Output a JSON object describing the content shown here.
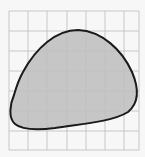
{
  "figure": {
    "background_color": "#f7f7f7",
    "grid": {
      "x_lines": [
        9,
        28,
        47,
        67,
        86,
        105,
        124,
        139
      ],
      "y_lines": [
        11,
        31,
        51,
        71,
        91,
        111,
        131,
        150
      ],
      "line_color": "#bfbfbf",
      "columns": 7,
      "rows": 7
    },
    "shape": {
      "fill_color": "#c6c6c6",
      "stroke_color": "#1a1a1a",
      "stroke_width": 2,
      "path": "M 23 72 C 36 48, 56 30, 78 30 C 102 31, 122 50, 132 72 C 138 86, 140 102, 128 112 C 112 122, 80 124, 55 128 C 38 130, 22 130, 15 124 C 8 118, 10 104, 14 95 C 16 88, 19 79, 23 72 Z"
    }
  }
}
